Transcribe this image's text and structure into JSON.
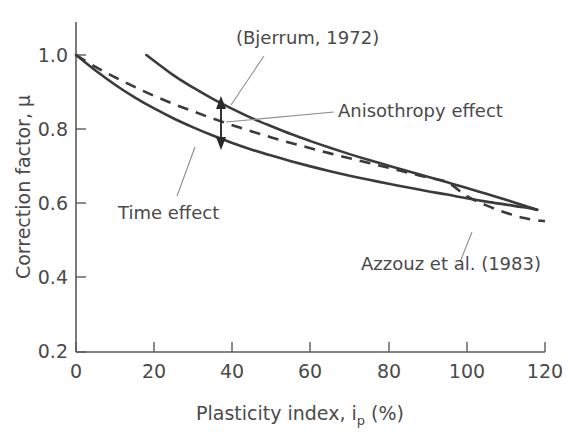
{
  "chart_data": {
    "type": "line",
    "title": "",
    "xlabel": "Plasticity index, i",
    "xlabel_sub": "p",
    "xlabel_suffix": " (%)",
    "ylabel": "Correction factor, μ",
    "xlim": [
      0,
      120
    ],
    "ylim": [
      0.2,
      1.0
    ],
    "xticks": [
      0,
      20,
      40,
      60,
      80,
      100,
      120
    ],
    "xtick_labels": [
      "0",
      "20",
      "40",
      "60",
      "80",
      "100",
      "120"
    ],
    "yticks": [
      0.2,
      0.4,
      0.6,
      0.8,
      1.0
    ],
    "ytick_labels": [
      "0.2",
      "0.4",
      "0.6",
      "0.8",
      "1.0"
    ],
    "grid": false,
    "legend_position": "none",
    "line_color": "#3b3b3b",
    "axis_color": "#5a5a5a",
    "leader_color": "#8d8d8d",
    "series": [
      {
        "name": "(Bjerrum, 1972) upper",
        "style": "solid",
        "x": [
          18,
          25,
          30,
          35,
          40,
          45,
          50,
          55,
          60,
          65,
          70,
          75,
          80,
          85,
          90,
          95,
          100,
          105,
          110,
          115,
          118
        ],
        "y": [
          1.0,
          0.945,
          0.912,
          0.882,
          0.855,
          0.83,
          0.808,
          0.787,
          0.768,
          0.75,
          0.733,
          0.717,
          0.702,
          0.687,
          0.672,
          0.657,
          0.642,
          0.626,
          0.61,
          0.593,
          0.583
        ]
      },
      {
        "name": "Lower bound (time effect)",
        "style": "solid",
        "x": [
          0,
          5,
          10,
          15,
          20,
          25,
          30,
          35,
          40,
          45,
          50,
          55,
          60,
          65,
          70,
          75,
          80,
          85,
          90,
          95,
          100,
          105,
          110,
          115,
          118
        ],
        "y": [
          1.0,
          0.958,
          0.92,
          0.886,
          0.856,
          0.829,
          0.805,
          0.783,
          0.763,
          0.745,
          0.729,
          0.714,
          0.7,
          0.687,
          0.675,
          0.664,
          0.653,
          0.643,
          0.633,
          0.624,
          0.614,
          0.605,
          0.597,
          0.589,
          0.583
        ]
      },
      {
        "name": "Azzouz et al. (1983)",
        "style": "dashed",
        "x": [
          0,
          5,
          10,
          15,
          20,
          25,
          30,
          35,
          40,
          45,
          50,
          55,
          60,
          65,
          70,
          75,
          80,
          85,
          90,
          95,
          100,
          105,
          110,
          115,
          120
        ],
        "y": [
          1.0,
          0.968,
          0.94,
          0.914,
          0.89,
          0.868,
          0.848,
          0.829,
          0.811,
          0.794,
          0.778,
          0.763,
          0.749,
          0.735,
          0.722,
          0.709,
          0.696,
          0.683,
          0.67,
          0.657,
          0.62,
          0.595,
          0.575,
          0.56,
          0.552
        ]
      }
    ],
    "annotations": [
      {
        "id": "bjerrum",
        "text": "(Bjerrum, 1972)",
        "x": 38,
        "y": 0.97
      },
      {
        "id": "anisotropy",
        "text": "Anisothropy effect",
        "x": 68,
        "y": 0.83
      },
      {
        "id": "time",
        "text": "Time effect",
        "x": 11,
        "y": 0.6
      },
      {
        "id": "azzouz",
        "text": "Azzouz et al. (1983)",
        "x": 84,
        "y": 0.47
      }
    ],
    "arrow": {
      "name": "anisotropy-double-arrow",
      "x": 37,
      "y_top": 0.862,
      "y_bottom": 0.748
    }
  }
}
